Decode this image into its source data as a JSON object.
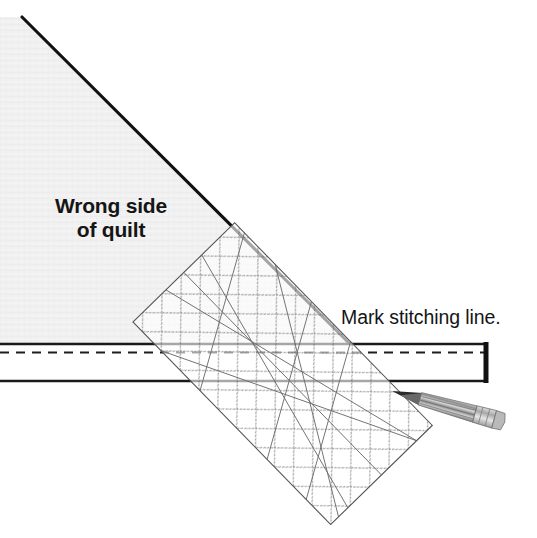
{
  "illustration": {
    "title": "Quilt binding mitered corner marking diagram",
    "labels": {
      "wrong_side": "Wrong side\nof quilt",
      "mark_line": "Mark stitching line."
    },
    "colors": {
      "quilt_fill": "#f1f1f1",
      "quilt_edge": "#111111",
      "line": "#1a1a1a",
      "ruler_grid": "#5a5a5a",
      "ruler_guide": "#6e6e6e",
      "pencil_body": "#9b9b9b",
      "pencil_tip": "#1b1b1b",
      "pencil_ferrule": "#c8c8c8",
      "background": "#ffffff"
    },
    "parts": [
      {
        "name": "quilt-wrong-side-triangle",
        "kind": "fabric-region"
      },
      {
        "name": "binding-strip",
        "kind": "fabric-region"
      },
      {
        "name": "raw-edge-line",
        "kind": "solid-line"
      },
      {
        "name": "stitching-line",
        "kind": "dashed-line"
      },
      {
        "name": "binding-fold-line",
        "kind": "solid-line"
      },
      {
        "name": "quilting-ruler",
        "kind": "tool"
      },
      {
        "name": "marking-pencil",
        "kind": "tool"
      }
    ],
    "ruler": {
      "corners": [
        [
          133,
          322
        ],
        [
          225,
          232
        ],
        [
          425,
          432
        ],
        [
          320,
          522
        ]
      ],
      "grid_spacing_px": 27,
      "grid_style": "dotted-diagonal-45",
      "guide_lines": 7
    },
    "geometry": {
      "quilt_diagonal_from": [
        22,
        17
      ],
      "quilt_diagonal_to": [
        350,
        344
      ],
      "raw_edge_y": 344,
      "stitching_dashed_y": 352,
      "binding_fold_y": 381,
      "strip_right_edge_x": 487,
      "pencil_tip": [
        392,
        391
      ],
      "pencil_end": [
        508,
        423
      ]
    }
  }
}
